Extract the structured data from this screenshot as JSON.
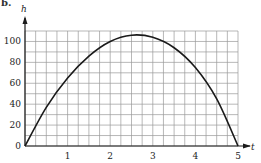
{
  "figure_marker": "b.",
  "chart_data": {
    "type": "line",
    "title": "",
    "xlabel": "t",
    "ylabel": "h",
    "xlim": [
      0,
      5
    ],
    "ylim": [
      0,
      110
    ],
    "x_ticks": [
      1,
      2,
      3,
      4,
      5
    ],
    "y_ticks": [
      0,
      20,
      40,
      60,
      80,
      100
    ],
    "x_tick_labels": [
      "1",
      "2",
      "3",
      "4",
      "5"
    ],
    "y_tick_labels": [
      "0",
      "20",
      "40",
      "60",
      "80",
      "100"
    ],
    "origin_label": "0",
    "grid": true,
    "grid_x_step": 0.25,
    "grid_y_step": 10,
    "legend": null,
    "series": [
      {
        "name": "h(t)",
        "x": [
          0,
          0.5,
          1,
          1.5,
          2,
          2.5,
          3,
          3.5,
          4,
          4.5,
          5
        ],
        "values": [
          0,
          37,
          65,
          86,
          100,
          106,
          104,
          94,
          75,
          45,
          0
        ]
      }
    ],
    "annotations": []
  }
}
